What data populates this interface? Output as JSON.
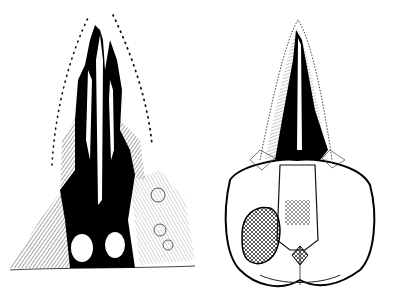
{
  "image": {
    "description": "Two pen-and-ink scientific illustrations of a skull",
    "panels": [
      {
        "id": "left",
        "view": "skull-view-left",
        "fill": "#000000"
      },
      {
        "id": "right",
        "view": "skull-view-right",
        "fill": "#000000"
      }
    ],
    "colors": {
      "background": "#ffffff",
      "ink": "#111111"
    }
  }
}
